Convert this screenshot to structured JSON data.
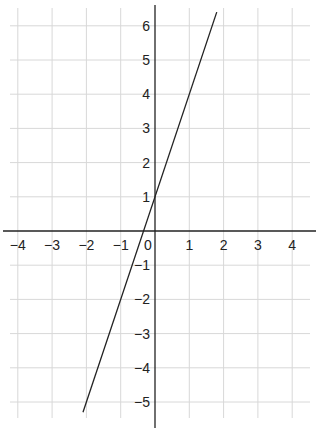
{
  "chart_data": {
    "type": "line",
    "title": "",
    "xlabel": "",
    "ylabel": "",
    "xlim": [
      -4.5,
      4.5
    ],
    "ylim": [
      -5.5,
      6.4
    ],
    "grid": true,
    "x_ticks": [
      -4,
      -3,
      -2,
      -1,
      0,
      1,
      2,
      3,
      4
    ],
    "y_ticks": [
      -5,
      -4,
      -3,
      -2,
      -1,
      1,
      2,
      3,
      4,
      5,
      6
    ],
    "x_tick_labels": [
      "−4",
      "−3",
      "−2",
      "−1",
      "0",
      "1",
      "2",
      "3",
      "4"
    ],
    "y_tick_labels": [
      "−5",
      "−4",
      "−3",
      "−2",
      "−1",
      "1",
      "2",
      "3",
      "4",
      "5",
      "6"
    ],
    "series": [
      {
        "name": "y = 3x + 1",
        "x": [
          -2.1,
          1.8
        ],
        "y": [
          -5.3,
          6.4
        ]
      }
    ],
    "colors": {
      "grid": "#d8d8d8",
      "axis": "#222222",
      "line": "#222222"
    }
  }
}
